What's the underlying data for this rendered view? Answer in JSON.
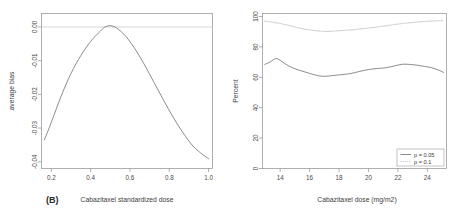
{
  "figure": {
    "panel_tag": "(B)",
    "background": "#ffffff",
    "line_color": "#6e6e6e",
    "dotted_color": "#b4b4b4",
    "axis_color": "#8e8e8e"
  },
  "chart_data": [
    {
      "type": "line",
      "id": "average-bias-panel",
      "title": "",
      "xlabel": "Cabazitaxel standardized dose",
      "ylabel": "average bias",
      "xlim": [
        0.15,
        1.02
      ],
      "ylim": [
        -0.042,
        0.004
      ],
      "xticks": [
        "0.2",
        "0.4",
        "0.6",
        "0.8",
        "1.0"
      ],
      "xtick_values": [
        0.2,
        0.4,
        0.6,
        0.8,
        1.0
      ],
      "yticks": [
        "0.00",
        "-0.01",
        "-0.02",
        "-0.03",
        "-0.04"
      ],
      "ytick_values": [
        0.0,
        -0.01,
        -0.02,
        -0.03,
        -0.04
      ],
      "grid": false,
      "legend": "none",
      "reference_line": {
        "y": 0.0,
        "color": "#d2d2d2",
        "style": "solid"
      },
      "series": [
        {
          "name": "average bias",
          "style": "solid",
          "color": "#6e6e6e",
          "x": [
            0.165,
            0.2,
            0.25,
            0.3,
            0.35,
            0.4,
            0.45,
            0.48,
            0.52,
            0.57,
            0.62,
            0.67,
            0.72,
            0.77,
            0.82,
            0.87,
            0.92,
            0.96,
            1.0
          ],
          "y": [
            -0.0335,
            -0.0283,
            -0.0205,
            -0.0138,
            -0.0085,
            -0.0043,
            -0.0012,
            0.0002,
            0.0001,
            -0.0022,
            -0.006,
            -0.0108,
            -0.0162,
            -0.0216,
            -0.0268,
            -0.0314,
            -0.0353,
            -0.0374,
            -0.0391
          ]
        }
      ]
    },
    {
      "type": "line",
      "id": "percent-panel",
      "title": "",
      "xlabel": "Cabazitaxel dose (mg/m2)",
      "ylabel": "Percent",
      "xlim": [
        12.8,
        25.3
      ],
      "ylim": [
        0,
        102
      ],
      "xticks": [
        "14",
        "16",
        "18",
        "20",
        "22",
        "24"
      ],
      "xtick_values": [
        14,
        16,
        18,
        20,
        22,
        24
      ],
      "yticks": [
        "100",
        "80",
        "60",
        "40",
        "20",
        "0"
      ],
      "ytick_values": [
        100,
        80,
        60,
        40,
        20,
        0
      ],
      "grid": false,
      "legend": "bottom-right",
      "series": [
        {
          "name": "p = 0.05",
          "style": "solid",
          "color": "#6e6e6e",
          "x": [
            12.95,
            13.3,
            13.7,
            14.0,
            14.4,
            14.9,
            15.4,
            16.0,
            16.6,
            17.1,
            17.6,
            18.2,
            18.8,
            19.4,
            20.0,
            20.6,
            21.2,
            21.8,
            22.3,
            22.8,
            23.3,
            23.8,
            24.3,
            24.8,
            25.1
          ],
          "y": [
            68.5,
            70.0,
            72.3,
            71.2,
            68.5,
            66.0,
            64.4,
            62.6,
            61.0,
            60.7,
            61.2,
            61.8,
            62.5,
            63.9,
            65.1,
            65.8,
            66.3,
            67.6,
            68.6,
            68.5,
            68.0,
            67.2,
            66.3,
            64.6,
            63.2
          ]
        },
        {
          "name": "p = 0.1",
          "style": "dotted",
          "color": "#b4b4b4",
          "x": [
            12.95,
            13.4,
            13.9,
            14.4,
            14.9,
            15.4,
            16.0,
            16.6,
            17.1,
            17.6,
            18.2,
            18.8,
            19.4,
            20.0,
            20.6,
            21.2,
            21.8,
            22.4,
            23.0,
            23.6,
            24.2,
            24.7,
            25.1
          ],
          "y": [
            97.0,
            96.4,
            95.6,
            94.6,
            93.4,
            92.2,
            91.2,
            90.5,
            90.2,
            90.4,
            90.8,
            91.2,
            91.8,
            92.4,
            93.1,
            93.9,
            94.8,
            95.5,
            96.1,
            96.6,
            97.0,
            97.2,
            97.3
          ]
        }
      ]
    }
  ],
  "legend": {
    "entries": [
      {
        "label": "p = 0.05",
        "style": "solid"
      },
      {
        "label": "p = 0.1",
        "style": "dotted"
      }
    ]
  }
}
